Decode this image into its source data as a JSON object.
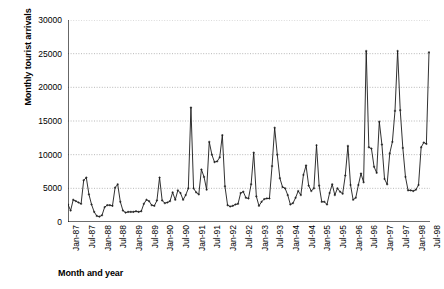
{
  "chart_data": {
    "type": "line",
    "title": "",
    "xlabel": "Month and year",
    "ylabel": "Monthly tourist arrivals",
    "ylim": [
      0,
      30000
    ],
    "yticks": [
      0,
      5000,
      10000,
      15000,
      20000,
      25000,
      30000
    ],
    "ytick_labels": [
      "0",
      "5000",
      "10000",
      "15000",
      "20000",
      "25000",
      "30000"
    ],
    "grid": true,
    "grid_axis": "y",
    "legend": "none",
    "series_name": "Monthly tourist arrivals",
    "line_color": "#1a1a1a",
    "marker": "cross",
    "x_start": "Jan-87",
    "x_end": "Jul-98",
    "x_step_months": 6,
    "xtick_labels": [
      "Jan-87",
      "Jul-87",
      "Jan-88",
      "Jul-88",
      "Jan-89",
      "Jul-89",
      "Jan-90",
      "Jul-90",
      "Jan-91",
      "Jul-91",
      "Jan-92",
      "Jul-92",
      "Jan-93",
      "Jul-93",
      "Jan-94",
      "Jul-94",
      "Jan-95",
      "Jul-95",
      "Jan-96",
      "Jul-96",
      "Jan-97",
      "Jul-97",
      "Jan-98",
      "Jul-98"
    ],
    "x": [
      "Jan-87",
      "Feb-87",
      "Mar-87",
      "Apr-87",
      "May-87",
      "Jun-87",
      "Jul-87",
      "Aug-87",
      "Sep-87",
      "Oct-87",
      "Nov-87",
      "Dec-87",
      "Jan-88",
      "Feb-88",
      "Mar-88",
      "Apr-88",
      "May-88",
      "Jun-88",
      "Jul-88",
      "Aug-88",
      "Sep-88",
      "Oct-88",
      "Nov-88",
      "Dec-88",
      "Jan-89",
      "Feb-89",
      "Mar-89",
      "Apr-89",
      "May-89",
      "Jun-89",
      "Jul-89",
      "Aug-89",
      "Sep-89",
      "Oct-89",
      "Nov-89",
      "Dec-89",
      "Jan-90",
      "Feb-90",
      "Mar-90",
      "Apr-90",
      "May-90",
      "Jun-90",
      "Jul-90",
      "Aug-90",
      "Sep-90",
      "Oct-90",
      "Nov-90",
      "Dec-90",
      "Jan-91",
      "Feb-91",
      "Mar-91",
      "Apr-91",
      "May-91",
      "Jun-91",
      "Jul-91",
      "Aug-91",
      "Sep-91",
      "Oct-91",
      "Nov-91",
      "Dec-91",
      "Jan-92",
      "Feb-92",
      "Mar-92",
      "Apr-92",
      "May-92",
      "Jun-92",
      "Jul-92",
      "Aug-92",
      "Sep-92",
      "Oct-92",
      "Nov-92",
      "Dec-92",
      "Jan-93",
      "Feb-93",
      "Mar-93",
      "Apr-93",
      "May-93",
      "Jun-93",
      "Jul-93",
      "Aug-93",
      "Sep-93",
      "Oct-93",
      "Nov-93",
      "Dec-93",
      "Jan-94",
      "Feb-94",
      "Mar-94",
      "Apr-94",
      "May-94",
      "Jun-94",
      "Jul-94",
      "Aug-94",
      "Sep-94",
      "Oct-94",
      "Nov-94",
      "Dec-94",
      "Jan-95",
      "Feb-95",
      "Mar-95",
      "Apr-95",
      "May-95",
      "Jun-95",
      "Jul-95",
      "Aug-95",
      "Sep-95",
      "Oct-95",
      "Nov-95",
      "Dec-95",
      "Jan-96",
      "Feb-96",
      "Mar-96",
      "Apr-96",
      "May-96",
      "Jun-96",
      "Jul-96",
      "Aug-96",
      "Sep-96",
      "Oct-96",
      "Nov-96",
      "Dec-96",
      "Jan-97",
      "Feb-97",
      "Mar-97",
      "Apr-97",
      "May-97",
      "Jun-97",
      "Jul-97",
      "Aug-97",
      "Sep-97",
      "Oct-97",
      "Nov-97",
      "Dec-97",
      "Jan-98",
      "Feb-98",
      "Mar-98",
      "Apr-98",
      "May-98",
      "Jun-98",
      "Jul-98"
    ],
    "values": [
      2600,
      1700,
      3300,
      3100,
      2900,
      2700,
      6200,
      6600,
      4100,
      2600,
      1500,
      900,
      800,
      1000,
      2200,
      2500,
      2500,
      2400,
      5100,
      5600,
      3000,
      1700,
      1400,
      1500,
      1500,
      1500,
      1600,
      1500,
      1600,
      2700,
      3300,
      3100,
      2500,
      2400,
      3200,
      6600,
      3200,
      2800,
      2900,
      3100,
      4400,
      3300,
      4700,
      4300,
      3300,
      4000,
      5000,
      17000,
      5000,
      4400,
      4100,
      7800,
      6700,
      4800,
      11900,
      10000,
      8900,
      9000,
      9600,
      12900,
      5300,
      2500,
      2300,
      2400,
      2600,
      2700,
      4300,
      4500,
      3600,
      3500,
      5600,
      10300,
      3800,
      2400,
      3000,
      3400,
      3500,
      3500,
      8300,
      14000,
      10000,
      6500,
      5200,
      5000,
      4000,
      2600,
      2800,
      3600,
      4600,
      4000,
      7000,
      8400,
      5400,
      4600,
      5000,
      11400,
      5400,
      3000,
      3000,
      2600,
      4300,
      5600,
      4000,
      5000,
      4500,
      4200,
      6900,
      11300,
      5500,
      3300,
      3600,
      5500,
      7200,
      5900,
      25400,
      11100,
      10900,
      8200,
      7300,
      14900,
      11500,
      6400,
      5600,
      10200,
      11900,
      16500,
      25400,
      16600,
      11000,
      6700,
      4700,
      4700,
      4600,
      4800,
      5500,
      11100,
      11800,
      11600,
      25200
    ]
  },
  "axis_titles": {
    "y": "Monthly tourist arrivals",
    "x": "Month and year"
  }
}
